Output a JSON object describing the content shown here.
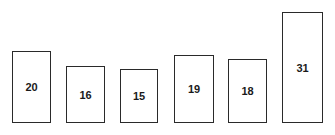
{
  "chart_data": {
    "type": "bar",
    "title": "",
    "xlabel": "",
    "ylabel": "",
    "categories": [
      "1",
      "2",
      "3",
      "4",
      "5",
      "6"
    ],
    "values": [
      20,
      16,
      15,
      19,
      18,
      31
    ],
    "data_labels": [
      "20",
      "16",
      "15",
      "19",
      "18",
      "31"
    ],
    "grid": false,
    "axes_visible": false,
    "legend": null,
    "bar_fill": "#ffffff",
    "bar_stroke": "#2a2a2a"
  },
  "layout": {
    "baseline_y": 123,
    "px_per_unit": 3.58,
    "bars": [
      {
        "x": 12,
        "w": 39
      },
      {
        "x": 66,
        "w": 39
      },
      {
        "x": 120,
        "w": 38
      },
      {
        "x": 174,
        "w": 40
      },
      {
        "x": 228,
        "w": 39
      },
      {
        "x": 282,
        "w": 41
      }
    ]
  }
}
